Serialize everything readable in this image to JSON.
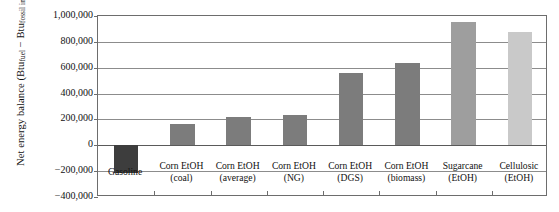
{
  "chart_data": {
    "type": "bar",
    "title": "",
    "xlabel": "",
    "ylabel": "Net energy balance (Btu_fuel − Btu_fossil input)",
    "ylabel_parts": {
      "prefix": "Net energy balance (Btu",
      "sub1": "fuel",
      "middle": " − Btu",
      "sub2": "fossil input",
      "suffix": ")"
    },
    "ylim": [
      -400000,
      1000000
    ],
    "ytick_labels": [
      "1,000,000",
      "800,000",
      "600,000",
      "400,000",
      "200,000",
      "0",
      "−200,000",
      "−400,000"
    ],
    "ytick_values": [
      1000000,
      800000,
      600000,
      400000,
      200000,
      0,
      -200000,
      -400000
    ],
    "grid": true,
    "legend": "none",
    "categories": [
      "Gasoline",
      "Corn EtOH (coal)",
      "Corn EtOH (average)",
      "Corn EtOH (NG)",
      "Corn EtOH (DGS)",
      "Corn EtOH (biomass)",
      "Sugarcane (EtOH)",
      "Cellulosic (EtOH)"
    ],
    "category_lines": [
      [
        "Gasoline",
        ""
      ],
      [
        "Corn EtOH",
        "(coal)"
      ],
      [
        "Corn EtOH",
        "(average)"
      ],
      [
        "Corn EtOH",
        "(NG)"
      ],
      [
        "Corn EtOH",
        "(DGS)"
      ],
      [
        "Corn EtOH",
        "(biomass)"
      ],
      [
        "Sugarcane",
        "(EtOH)"
      ],
      [
        "Cellulosic",
        "(EtOH)"
      ]
    ],
    "values": [
      -215000,
      165000,
      215000,
      235000,
      560000,
      640000,
      955000,
      875000
    ],
    "bar_colors": [
      "#3d3d3d",
      "#7c7c7c",
      "#7c7c7c",
      "#7c7c7c",
      "#7c7c7c",
      "#7c7c7c",
      "#9e9e9e",
      "#c9c9c9"
    ]
  }
}
